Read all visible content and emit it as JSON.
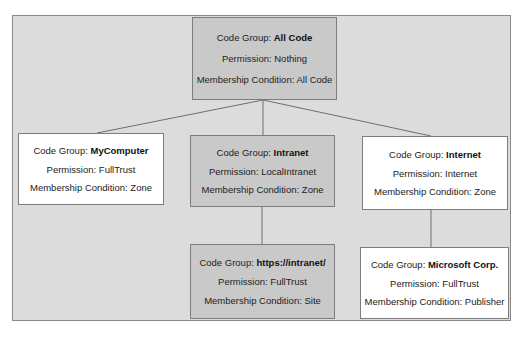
{
  "diagram": {
    "type": "tree",
    "labels": {
      "code_group": "Code Group: ",
      "permission": "Permission: ",
      "membership": "Membership Condition: "
    },
    "nodes": [
      {
        "id": "allcode",
        "code_group": "All Code",
        "permission": "Nothing",
        "membership": "All Code",
        "fill": "#c9c9c9",
        "parent": null
      },
      {
        "id": "mycomputer",
        "code_group": "MyComputer",
        "permission": "FullTrust",
        "membership": "Zone",
        "fill": "#ffffff",
        "parent": "allcode"
      },
      {
        "id": "intranet",
        "code_group": "Intranet",
        "permission": "LocalIntranet",
        "membership": "Zone",
        "fill": "#c9c9c9",
        "parent": "allcode"
      },
      {
        "id": "internet",
        "code_group": "Internet",
        "permission": "Internet",
        "membership": "Zone",
        "fill": "#ffffff",
        "parent": "allcode"
      },
      {
        "id": "https-intranet",
        "code_group": "https://intranet/",
        "permission": "FullTrust",
        "membership": "Site",
        "fill": "#c9c9c9",
        "parent": "intranet"
      },
      {
        "id": "microsoft-corp",
        "code_group": "Microsoft Corp.",
        "permission": "FullTrust",
        "membership": "Publisher",
        "fill": "#ffffff",
        "parent": "internet"
      }
    ],
    "colors": {
      "background_frame": "#dcdcdc",
      "highlighted_node": "#c9c9c9",
      "plain_node": "#ffffff",
      "border": "#7d7d7d",
      "connector": "#6e6e6e"
    }
  }
}
